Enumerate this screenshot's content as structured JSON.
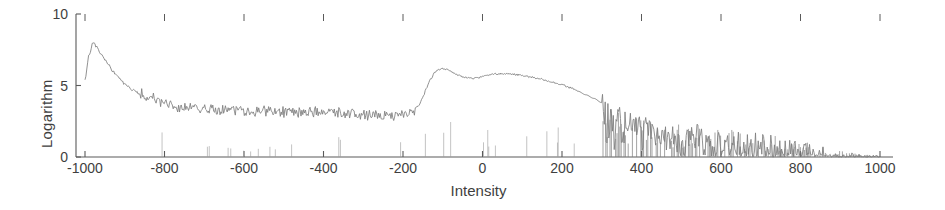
{
  "chart_data": {
    "type": "line",
    "title": "",
    "xlabel": "Intensity",
    "ylabel": "Logarithm",
    "xlim": [
      -1050,
      1020
    ],
    "ylim": [
      0,
      10
    ],
    "xticks": [
      -1000,
      -800,
      -600,
      -400,
      -200,
      0,
      200,
      400,
      600,
      800,
      1000
    ],
    "xtick_labels": [
      "-1000",
      "-800",
      "-600",
      "-400",
      "-200",
      "0",
      "200",
      "400",
      "600",
      "800",
      "1000"
    ],
    "yticks": [
      0,
      5,
      10
    ],
    "ytick_labels": [
      "0",
      "5",
      "10"
    ],
    "grid": false,
    "legend": null,
    "line_color": "#7d7d7d",
    "axis_color": "#5a5a5a",
    "top_ticks": true,
    "tick_direction": "in",
    "series": [
      {
        "name": "spectrum",
        "description": "Sharp peak near -980 decaying to a noisy plateau, broad double-humped band centred near -100 and +60, then decaying noise spikes to +1000",
        "x": [
          -1000,
          -990,
          -980,
          -970,
          -960,
          -950,
          -940,
          -930,
          -920,
          -910,
          -900,
          -880,
          -860,
          -840,
          -820,
          -800,
          -780,
          -760,
          -740,
          -720,
          -700,
          -680,
          -660,
          -640,
          -620,
          -600,
          -580,
          -560,
          -540,
          -520,
          -500,
          -480,
          -460,
          -440,
          -420,
          -400,
          -380,
          -360,
          -340,
          -320,
          -300,
          -280,
          -260,
          -240,
          -220,
          -200,
          -180,
          -160,
          -150,
          -140,
          -130,
          -120,
          -110,
          -100,
          -90,
          -80,
          -70,
          -60,
          -50,
          -40,
          -30,
          -20,
          -10,
          0,
          10,
          20,
          30,
          40,
          50,
          60,
          70,
          80,
          90,
          100,
          120,
          140,
          160,
          180,
          200,
          220,
          240,
          260,
          280,
          300,
          320,
          340,
          360,
          380,
          400,
          440,
          480,
          520,
          560,
          600,
          640,
          680,
          720,
          760,
          800,
          840,
          880,
          920,
          960,
          1000
        ],
        "y": [
          5.4,
          7.1,
          8.0,
          7.7,
          7.2,
          6.8,
          6.4,
          6.0,
          5.7,
          5.4,
          5.1,
          4.7,
          4.4,
          4.2,
          4.0,
          3.8,
          3.6,
          3.5,
          3.45,
          3.4,
          3.35,
          3.3,
          3.3,
          3.28,
          3.25,
          3.25,
          3.22,
          3.2,
          3.2,
          3.18,
          3.2,
          3.18,
          3.2,
          3.18,
          3.2,
          3.2,
          3.15,
          3.1,
          3.05,
          3.0,
          2.95,
          2.9,
          2.95,
          2.9,
          2.95,
          3.0,
          3.1,
          3.6,
          4.2,
          4.9,
          5.5,
          5.9,
          6.1,
          6.2,
          6.15,
          6.0,
          5.85,
          5.7,
          5.6,
          5.55,
          5.5,
          5.5,
          5.55,
          5.62,
          5.7,
          5.75,
          5.8,
          5.82,
          5.83,
          5.83,
          5.8,
          5.78,
          5.75,
          5.7,
          5.6,
          5.5,
          5.35,
          5.2,
          5.05,
          4.85,
          4.6,
          4.35,
          4.1,
          3.8,
          3.45,
          3.1,
          2.8,
          2.55,
          2.4,
          2.2,
          2.1,
          1.95,
          1.85,
          1.75,
          1.6,
          1.5,
          1.35,
          1.2,
          1.0,
          0.75,
          0.5,
          0.3,
          0.15,
          0.1
        ],
        "noise": {
          "plateau_range": [
            -860,
            -170
          ],
          "plateau_amplitude": 0.45,
          "tail_range": [
            300,
            1000
          ],
          "tail_style": "downward-spikes-to-zero"
        }
      }
    ]
  }
}
